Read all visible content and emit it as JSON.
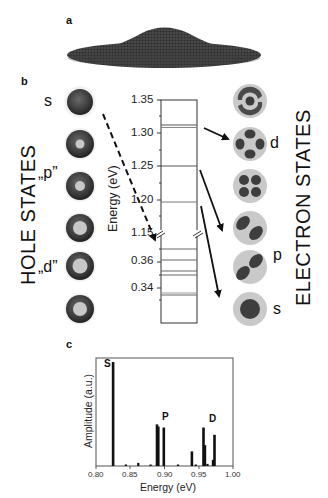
{
  "panels": {
    "a": {
      "label": "a",
      "description": "atomistic model of lens-shaped quantum dot on wetting layer"
    },
    "b": {
      "label": "b",
      "hole_side": {
        "title": "HOLE STATES",
        "state_labels": [
          {
            "text": "s",
            "index": 0
          },
          {
            "text": "„p”",
            "index": 1
          },
          {
            "text": "„d”",
            "index": 3
          }
        ],
        "circles": [
          {
            "type": "solid"
          },
          {
            "type": "ring-small-hole"
          },
          {
            "type": "ring-small-hole"
          },
          {
            "type": "ring-large-hole"
          },
          {
            "type": "ring-large-hole"
          },
          {
            "type": "ring-large-hole"
          }
        ]
      },
      "energy_axis": {
        "title": "Energy (eV)",
        "upper_ticks": [
          "1.35",
          "1.30",
          "1.25",
          "1.20",
          "1.15"
        ],
        "lower_ticks": [
          "0.36",
          "0.34"
        ],
        "electron_levels_eV": [
          1.312,
          1.309,
          1.252,
          1.198
        ],
        "hole_levels_eV": [
          0.368,
          0.361,
          0.357,
          0.354,
          0.337,
          0.336,
          0.333
        ]
      },
      "electron_side": {
        "title": "ELECTRON STATES",
        "state_labels": [
          {
            "text": "d",
            "index": 1
          },
          {
            "text": "p",
            "index": 3
          },
          {
            "text": "s",
            "index": 5
          }
        ],
        "circles": [
          {
            "type": "ring-with-core"
          },
          {
            "type": "four-lobe-cross"
          },
          {
            "type": "four-lobe-square"
          },
          {
            "type": "two-lobe"
          },
          {
            "type": "two-lobe"
          },
          {
            "type": "single-core"
          }
        ]
      }
    },
    "c": {
      "label": "c"
    }
  },
  "chart_data": {
    "type": "bar",
    "title": "",
    "xlabel": "Energy (eV)",
    "ylabel": "Amplitude (a.u.)",
    "xlim": [
      0.8,
      1.0
    ],
    "x_ticks": [
      "0.80",
      "0.85",
      "0.90",
      "0.95",
      "1.00"
    ],
    "grid": false,
    "annotations": [
      {
        "text": "S",
        "x": 0.822,
        "y": 0.98
      },
      {
        "text": "P",
        "x": 0.897,
        "y": 0.4
      },
      {
        "text": "D",
        "x": 0.962,
        "y": 0.36
      }
    ],
    "series": [
      {
        "name": "Amplitude",
        "x": [
          0.825,
          0.844,
          0.862,
          0.88,
          0.889,
          0.891,
          0.899,
          0.92,
          0.94,
          0.946,
          0.957,
          0.959,
          0.963,
          0.971,
          0.973
        ],
        "values": [
          1.0,
          0.01,
          0.03,
          0.01,
          0.4,
          0.38,
          0.37,
          0.01,
          0.14,
          0.01,
          0.37,
          0.2,
          0.02,
          0.06,
          0.3
        ]
      }
    ]
  }
}
